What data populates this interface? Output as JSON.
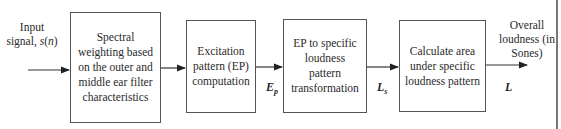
{
  "diagram": {
    "type": "block-diagram",
    "input": {
      "label_line1": "Input",
      "label_line2_prefix": "signal, ",
      "label_var": "s",
      "label_var_arg": "n"
    },
    "blocks": [
      {
        "lines": [
          "Spectral",
          "weighting based",
          "on the outer and",
          "middle ear filter",
          "characteristics"
        ]
      },
      {
        "lines": [
          "Excitation",
          "pattern (EP)",
          "computation"
        ]
      },
      {
        "lines": [
          "EP to specific",
          "loudness",
          "pattern",
          "transformation"
        ]
      },
      {
        "lines": [
          "Calculate area",
          "under specific",
          "loudness pattern"
        ]
      }
    ],
    "signals": [
      {
        "symbol": "E",
        "subscript": "p"
      },
      {
        "symbol": "L",
        "subscript": "s"
      },
      {
        "symbol": "L",
        "subscript": ""
      }
    ],
    "output": {
      "lines": [
        "Overall",
        "loudness (in",
        "Sones)"
      ]
    }
  }
}
